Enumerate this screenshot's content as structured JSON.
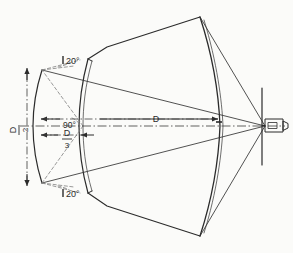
{
  "figure": {
    "background_color": "#fbfbf9",
    "line_color": "#2b2b2b",
    "thin_line_color": "#555555",
    "construction_line_color": "#777777"
  },
  "labels": {
    "angle_top": "20°",
    "angle_bottom": "20°",
    "vertex_angle": "90°",
    "focal_distance": "D",
    "aperture_numerator": "D",
    "aperture_denominator": "2",
    "inner_numerator": "D",
    "inner_denominator": "3"
  },
  "annotations": {
    "aperture_dimension_name": "D/2",
    "inner_dimension_name": "D/3",
    "axis_dimension_name": "D"
  },
  "components": {
    "outer_shell": "outer-faceted-shell",
    "outer_dome": "outer-curved-dome-wall",
    "inner_dome": "inner-curved-dome-wall",
    "left_arc": "left-small-arc",
    "focal_plate": "vertical-focal-plate",
    "source": "source-tube-assembly"
  }
}
